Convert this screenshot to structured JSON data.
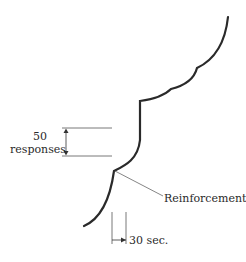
{
  "diagram": {
    "type": "cumulative-record",
    "labels": {
      "scale_value": "50",
      "scale_unit": "responses",
      "reinforcement": "Reinforcement",
      "time_scale": "30 sec."
    },
    "colors": {
      "curve": "#2a2a2a",
      "guide": "#555555",
      "background": "#ffffff"
    }
  }
}
